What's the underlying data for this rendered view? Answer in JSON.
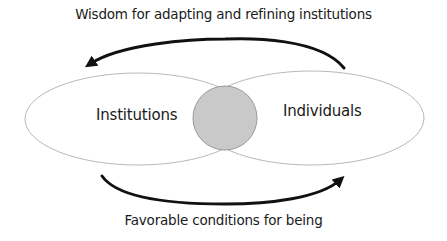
{
  "diagram": {
    "top_arrow_label": "Wisdom for adapting and refining institutions",
    "bottom_arrow_label": "Favorable conditions for being",
    "nodes": [
      {
        "id": "left",
        "label": "Institutions"
      },
      {
        "id": "right",
        "label": "Individuals"
      }
    ],
    "overlap": {
      "shape": "circle",
      "fill": "#c9c9c9"
    },
    "edges": [
      {
        "from": "Individuals",
        "to": "Institutions",
        "label": "Wisdom for adapting and refining institutions",
        "direction": "right-to-left",
        "position": "top"
      },
      {
        "from": "Institutions",
        "to": "Individuals",
        "label": "Favorable conditions for being",
        "direction": "left-to-right",
        "position": "bottom"
      }
    ],
    "colors": {
      "ellipse_stroke": "#b8b8b8",
      "circle_fill": "#c9c9c9",
      "circle_stroke": "#9a9a9a",
      "arrow": "#111111",
      "text": "#1a1a1a"
    }
  }
}
